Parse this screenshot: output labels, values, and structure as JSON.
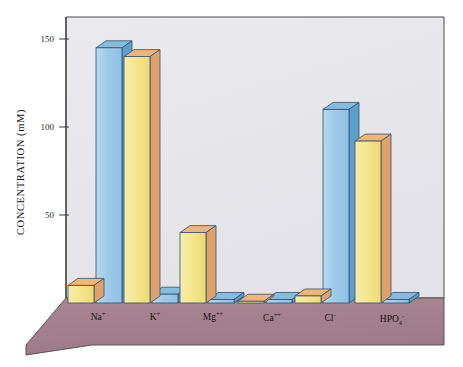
{
  "chart_data": {
    "type": "bar",
    "title": "",
    "xlabel": "",
    "ylabel": "CONCENTRATION (mM)",
    "units": "mM",
    "categories": [
      "Na+",
      "K+",
      "Mg++",
      "Ca++",
      "Cl-",
      "HPO4-"
    ],
    "category_labels": [
      {
        "base": "Na",
        "sup": "+",
        "sub": ""
      },
      {
        "base": "K",
        "sup": "+",
        "sub": ""
      },
      {
        "base": "Mg",
        "sup": "++",
        "sub": ""
      },
      {
        "base": "Ca",
        "sup": "++",
        "sub": ""
      },
      {
        "base": "Cl",
        "sup": "-",
        "sub": ""
      },
      {
        "base": "HPO",
        "sup": "-",
        "sub": "4"
      }
    ],
    "series": [
      {
        "name": "intracellular",
        "color": "#f3e48d",
        "side_color": "#e3a46b",
        "top_color": "#edb878",
        "values": [
          10,
          140,
          40,
          1,
          4,
          92
        ]
      },
      {
        "name": "extracellular",
        "color": "#9fcbe8",
        "side_color": "#5fa3ce",
        "top_color": "#7fbcdf",
        "values": [
          145,
          5,
          2,
          2,
          110,
          2
        ]
      }
    ],
    "ylim": [
      0,
      160
    ],
    "yticks": [
      50,
      100,
      150
    ],
    "ytick_labels": [
      "50",
      "100",
      "150"
    ],
    "grid": false,
    "legend": "none",
    "projection": "3d-isometric",
    "floor_color": "#a4818f",
    "wall_color": "#e7e7ec"
  },
  "figure": {
    "background_color": "#ffffff",
    "frame_color": "#3b3b3b"
  }
}
